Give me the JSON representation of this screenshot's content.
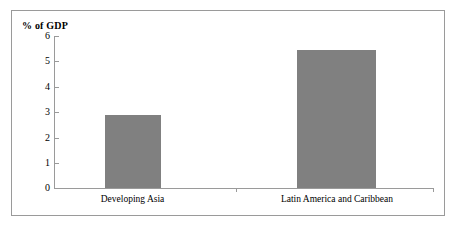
{
  "chart_data": {
    "type": "bar",
    "title": "",
    "subtitle": "",
    "xlabel": "",
    "ylabel": "% of GDP",
    "ylim": [
      0,
      6
    ],
    "yticks": [
      "0",
      "1",
      "2",
      "3",
      "4",
      "5",
      "6"
    ],
    "grid": false,
    "legend": "none",
    "bar_color": "#808080",
    "frame_color": "#9a9a9a",
    "categories": [
      "Developing Asia",
      "Latin America and Caribbean"
    ],
    "values": [
      2.9,
      5.45
    ],
    "series": [
      {
        "name": "% of GDP",
        "values": [
          2.9,
          5.45
        ]
      }
    ]
  }
}
